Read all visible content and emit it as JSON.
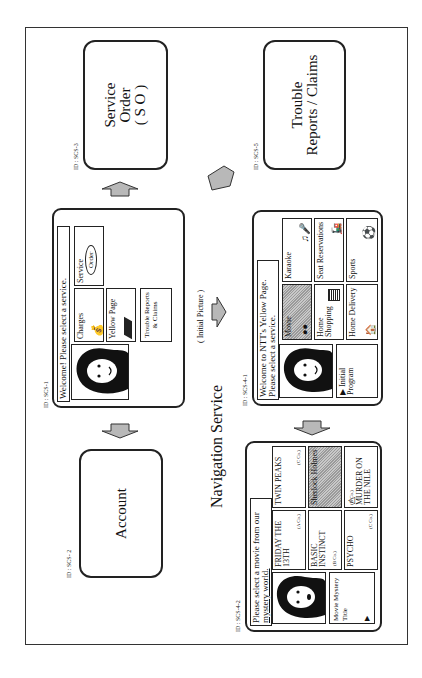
{
  "diagram": {
    "title": "Navigation Service",
    "initial_picture_label": "( Initial Picture )",
    "arrow_fill": "#b8b8b8"
  },
  "nodes": {
    "scs1": {
      "id": "ID : SCS-1",
      "message": "Welcome! Please select a service.",
      "tiles": [
        "Charges",
        "Yellow Page",
        "Trouble Reports & Claims",
        "Service",
        "Order"
      ]
    },
    "scs2": {
      "id": "ID : SCS- 2",
      "label": "Account"
    },
    "scs3": {
      "id": "ID : SCS-3",
      "lines": [
        "Service",
        "Order",
        "( S O )"
      ]
    },
    "scs5": {
      "id": "ID : SCS-5",
      "lines": [
        "Trouble",
        "Reports / Claims"
      ]
    },
    "scs41": {
      "id": "ID : SCS-4-1",
      "message_line1": "Welcome to NTT's Yellow Page.",
      "message_line2": "Please select  a service.",
      "initial_program": "Initial Program",
      "tiles": {
        "movie": "Movie",
        "karaoke": "Karaoke",
        "home_shopping": "Home Shopping",
        "seat_reservations": "Seat Reservations",
        "home_delivery": "Home Delivery",
        "sports": "Sports"
      }
    },
    "scs42": {
      "id": "ID : SCS-4-2",
      "message_line1": "Please select a movie  from our",
      "message_line2": "mystery world.",
      "side_label": "Movie Mystery Title",
      "tiles": {
        "friday": "FRIDAY THE 13TH",
        "friday_co": "(A Co.)",
        "twin": "TWIN PEAKS",
        "twin_co": "(C Co.)",
        "basic": "BASIC INSTINCT",
        "basic_co": "(B Co.)",
        "sherlock": "Sherlock Holmes",
        "psycho": "PSYCHO",
        "psycho_co": "(C Co.)",
        "murder": "MURDER ON THE NILE",
        "murder_co": "(B Co.)"
      }
    }
  }
}
